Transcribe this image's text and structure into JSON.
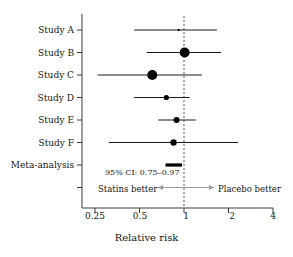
{
  "chart_data": {
    "type": "scatter",
    "subtype": "forest-plot",
    "title": "",
    "xlabel": "Relative risk",
    "ylabel": "",
    "xscale": "log",
    "xlim": [
      0.22,
      4.3
    ],
    "xticks": [
      0.25,
      0.5,
      1,
      2,
      4
    ],
    "xticklabels": [
      "0.25",
      "0.5",
      "1",
      "2",
      "4"
    ],
    "grid": false,
    "reference_line": {
      "value": 1,
      "style": "dashed"
    },
    "categories": [
      "Study A",
      "Study B",
      "Study C",
      "Study D",
      "Study E",
      "Study F",
      "Meta-analysis"
    ],
    "rows": [
      {
        "label": "Study A",
        "estimate": 0.92,
        "ci_low": 0.46,
        "ci_high": 1.67,
        "marker": "square",
        "marker_size": 2.0,
        "is_summary": false
      },
      {
        "label": "Study B",
        "estimate": 1.01,
        "ci_low": 0.56,
        "ci_high": 1.78,
        "marker": "circle",
        "marker_size": 5.0,
        "is_summary": false
      },
      {
        "label": "Study C",
        "estimate": 0.61,
        "ci_low": 0.26,
        "ci_high": 1.32,
        "marker": "circle",
        "marker_size": 5.0,
        "is_summary": false
      },
      {
        "label": "Study D",
        "estimate": 0.76,
        "ci_low": 0.46,
        "ci_high": 1.09,
        "marker": "circle",
        "marker_size": 2.6,
        "is_summary": false
      },
      {
        "label": "Study E",
        "estimate": 0.89,
        "ci_low": 0.67,
        "ci_high": 1.2,
        "marker": "circle",
        "marker_size": 3.0,
        "is_summary": false
      },
      {
        "label": "Study F",
        "estimate": 0.85,
        "ci_low": 0.31,
        "ci_high": 2.32,
        "marker": "circle",
        "marker_size": 3.2,
        "is_summary": false
      },
      {
        "label": "Meta-analysis",
        "estimate": 0.86,
        "ci_low": 0.75,
        "ci_high": 0.97,
        "marker": "bar",
        "marker_size": 0,
        "is_summary": true
      }
    ],
    "annotations": [
      {
        "name": "summary-ci-text",
        "text": "95% CI: 0.75–0.97"
      },
      {
        "name": "left-direction-label",
        "text": "Statins better"
      },
      {
        "name": "right-direction-label",
        "text": "Placebo better"
      }
    ]
  },
  "colors": {
    "line": "#1a1a1a",
    "marker": "#000000",
    "axis": "#3a3a3a",
    "reference": "#555555",
    "arrow": "#9a9a9a",
    "background": "#ffffff"
  }
}
